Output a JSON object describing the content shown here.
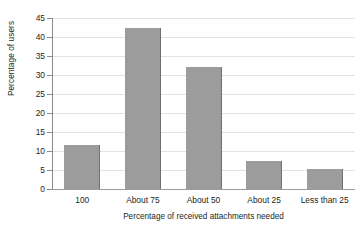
{
  "chart_data": {
    "type": "bar",
    "title": "",
    "xlabel": "Percentage of received attachments needed",
    "ylabel": "Percentage of users",
    "categories": [
      "100",
      "About 75",
      "About 50",
      "About 25",
      "Less than 25"
    ],
    "values": [
      11.5,
      42.3,
      32.0,
      7.5,
      5.2
    ],
    "ylim": [
      0,
      45
    ],
    "yticks": [
      0,
      5,
      10,
      15,
      20,
      25,
      30,
      35,
      40,
      45
    ],
    "ytick_labels": [
      "0",
      "5",
      "10",
      "15",
      "20",
      "25",
      "30",
      "35",
      "40",
      "45"
    ],
    "grid": true,
    "legend": false,
    "bar_color": "#9c9c9c",
    "bar_edge_color": "#6f6f6f",
    "gridline_color": "#e3e3e3",
    "axis_color": "#8a8a8a",
    "background_color": "#ffffff"
  }
}
